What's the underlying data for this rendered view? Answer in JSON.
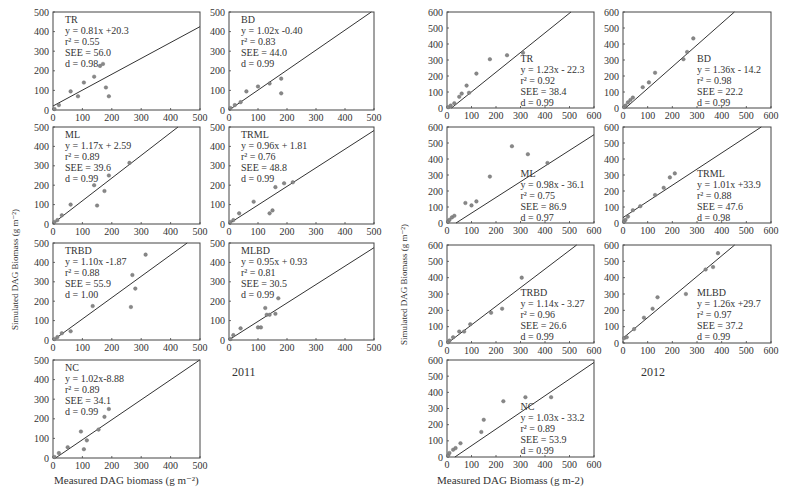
{
  "figure": {
    "left_year": "2011",
    "right_year": "2012",
    "left_xlabel": "Measured DAG biomass (g m⁻²)",
    "right_xlabel": "Measured DAG Biomass (g m-2)",
    "left_ylabel": "Simulated DAG Biomass (g m⁻²)",
    "right_ylabel": "Simulated DAG Biomass (g m⁻²)",
    "colors": {
      "axis": "#444444",
      "line": "#333333",
      "point": "#888888",
      "text": "#333333"
    }
  },
  "chart_data": [
    {
      "type": "scatter",
      "group": "2011",
      "title": "TR",
      "stats": [
        "TR",
        "y = 0.81x +20.3",
        "r² = 0.55",
        "SEE = 56.0",
        "d = 0.98"
      ],
      "slope": 0.81,
      "intercept": 20.3,
      "xlim": [
        0,
        500
      ],
      "ylim": [
        0,
        500
      ],
      "xticks": [
        0,
        100,
        200,
        300,
        400,
        500
      ],
      "yticks": [
        0,
        100,
        200,
        300,
        400,
        500
      ],
      "points": [
        [
          5,
          5
        ],
        [
          20,
          25
        ],
        [
          60,
          95
        ],
        [
          85,
          70
        ],
        [
          105,
          140
        ],
        [
          140,
          170
        ],
        [
          160,
          225
        ],
        [
          170,
          235
        ],
        [
          180,
          115
        ],
        [
          190,
          70
        ]
      ],
      "text_pos": "top-left"
    },
    {
      "type": "scatter",
      "group": "2011",
      "title": "BD",
      "stats": [
        "BD",
        "y = 1.02x -0.40",
        "r² = 0.83",
        "SEE = 44.0",
        "d = 0.99"
      ],
      "slope": 1.02,
      "intercept": -0.4,
      "xlim": [
        0,
        500
      ],
      "ylim": [
        0,
        500
      ],
      "xticks": [
        0,
        100,
        200,
        300,
        400,
        500
      ],
      "yticks": [
        0,
        100,
        200,
        300,
        400,
        500
      ],
      "points": [
        [
          5,
          10
        ],
        [
          20,
          25
        ],
        [
          40,
          40
        ],
        [
          60,
          95
        ],
        [
          100,
          120
        ],
        [
          140,
          135
        ],
        [
          180,
          160
        ],
        [
          180,
          85
        ]
      ],
      "text_pos": "top-left"
    },
    {
      "type": "scatter",
      "group": "2011",
      "title": "ML",
      "stats": [
        "ML",
        "y = 1.17x + 2.59",
        "r² = 0.89",
        "SEE = 39.6",
        "d = 0.99"
      ],
      "slope": 1.17,
      "intercept": 2.59,
      "xlim": [
        0,
        500
      ],
      "ylim": [
        0,
        500
      ],
      "xticks": [
        0,
        100,
        200,
        300,
        400,
        500
      ],
      "yticks": [
        0,
        100,
        200,
        300,
        400,
        500
      ],
      "points": [
        [
          5,
          10
        ],
        [
          15,
          20
        ],
        [
          30,
          45
        ],
        [
          60,
          100
        ],
        [
          140,
          200
        ],
        [
          150,
          95
        ],
        [
          175,
          170
        ],
        [
          190,
          250
        ],
        [
          260,
          315
        ]
      ],
      "text_pos": "top-left"
    },
    {
      "type": "scatter",
      "group": "2011",
      "title": "TRML",
      "stats": [
        "TRML",
        "y = 0.96x + 1.81",
        "r² = 0.76",
        "SEE = 48.8",
        "d = 0.99"
      ],
      "slope": 0.96,
      "intercept": 1.81,
      "xlim": [
        0,
        500
      ],
      "ylim": [
        0,
        500
      ],
      "xticks": [
        0,
        100,
        200,
        300,
        400,
        500
      ],
      "yticks": [
        0,
        100,
        200,
        300,
        400,
        500
      ],
      "points": [
        [
          5,
          10
        ],
        [
          15,
          20
        ],
        [
          35,
          55
        ],
        [
          85,
          115
        ],
        [
          140,
          55
        ],
        [
          150,
          70
        ],
        [
          160,
          190
        ],
        [
          190,
          210
        ],
        [
          220,
          215
        ]
      ],
      "text_pos": "top-left"
    },
    {
      "type": "scatter",
      "group": "2011",
      "title": "TRBD",
      "stats": [
        "TRBD",
        "y = 1.10x -1.87",
        "r² = 0.88",
        "SEE = 55.9",
        "d = 1.00"
      ],
      "slope": 1.1,
      "intercept": -1.87,
      "xlim": [
        0,
        500
      ],
      "ylim": [
        0,
        500
      ],
      "xticks": [
        0,
        100,
        200,
        300,
        400,
        500
      ],
      "yticks": [
        0,
        100,
        200,
        300,
        400,
        500
      ],
      "points": [
        [
          5,
          5
        ],
        [
          15,
          15
        ],
        [
          30,
          35
        ],
        [
          60,
          45
        ],
        [
          135,
          175
        ],
        [
          265,
          170
        ],
        [
          270,
          335
        ],
        [
          280,
          265
        ],
        [
          315,
          440
        ]
      ],
      "text_pos": "top-left"
    },
    {
      "type": "scatter",
      "group": "2011",
      "title": "MLBD",
      "stats": [
        "MLBD",
        "y = 0.95x + 0.93",
        "r² = 0.81",
        "SEE = 30.5",
        "d = 0.99"
      ],
      "slope": 0.95,
      "intercept": 0.93,
      "xlim": [
        0,
        500
      ],
      "ylim": [
        0,
        500
      ],
      "xticks": [
        0,
        100,
        200,
        300,
        400,
        500
      ],
      "yticks": [
        0,
        100,
        200,
        300,
        400,
        500
      ],
      "points": [
        [
          5,
          5
        ],
        [
          15,
          25
        ],
        [
          40,
          60
        ],
        [
          100,
          65
        ],
        [
          110,
          65
        ],
        [
          125,
          165
        ],
        [
          130,
          130
        ],
        [
          140,
          130
        ],
        [
          160,
          135
        ],
        [
          170,
          215
        ]
      ],
      "text_pos": "top-left"
    },
    {
      "type": "scatter",
      "group": "2011",
      "title": "NC",
      "stats": [
        "NC",
        "y = 1.02x-8.88",
        "r² = 0.89",
        "SEE = 34.1",
        "d = 0.99"
      ],
      "slope": 1.02,
      "intercept": -8.88,
      "xlim": [
        0,
        500
      ],
      "ylim": [
        0,
        500
      ],
      "xticks": [
        0,
        100,
        200,
        300,
        400,
        500
      ],
      "yticks": [
        0,
        100,
        200,
        300,
        400,
        500
      ],
      "points": [
        [
          5,
          5
        ],
        [
          20,
          25
        ],
        [
          50,
          55
        ],
        [
          95,
          135
        ],
        [
          105,
          45
        ],
        [
          115,
          90
        ],
        [
          155,
          145
        ],
        [
          175,
          210
        ],
        [
          190,
          250
        ]
      ],
      "text_pos": "top-left"
    },
    {
      "type": "scatter",
      "group": "2012",
      "title": "TR",
      "stats": [
        "TR",
        "y = 1.23x - 22.3",
        "r² = 0.92",
        "SEE = 38.4",
        "d = 0.99"
      ],
      "slope": 1.23,
      "intercept": -22.3,
      "xlim": [
        0,
        600
      ],
      "ylim": [
        0,
        600
      ],
      "xticks": [
        0,
        100,
        200,
        300,
        400,
        500,
        600
      ],
      "yticks": [
        0,
        100,
        200,
        300,
        400,
        500,
        600
      ],
      "points": [
        [
          5,
          5
        ],
        [
          15,
          15
        ],
        [
          30,
          30
        ],
        [
          50,
          70
        ],
        [
          60,
          90
        ],
        [
          80,
          140
        ],
        [
          90,
          95
        ],
        [
          120,
          215
        ],
        [
          175,
          305
        ],
        [
          245,
          330
        ],
        [
          310,
          345
        ]
      ],
      "text_pos": "bottom-right"
    },
    {
      "type": "scatter",
      "group": "2012",
      "title": "BD",
      "stats": [
        "BD",
        "y = 1.36x - 14.2",
        "r² = 0.98",
        "SEE = 22.2",
        "d = 0.99"
      ],
      "slope": 1.36,
      "intercept": -14.2,
      "xlim": [
        0,
        600
      ],
      "ylim": [
        0,
        600
      ],
      "xticks": [
        0,
        100,
        200,
        300,
        400,
        500,
        600
      ],
      "yticks": [
        0,
        100,
        200,
        300,
        400,
        500,
        600
      ],
      "points": [
        [
          5,
          5
        ],
        [
          10,
          15
        ],
        [
          20,
          35
        ],
        [
          30,
          50
        ],
        [
          40,
          65
        ],
        [
          80,
          130
        ],
        [
          105,
          160
        ],
        [
          130,
          220
        ],
        [
          245,
          305
        ],
        [
          260,
          350
        ],
        [
          285,
          435
        ]
      ],
      "text_pos": "bottom-right"
    },
    {
      "type": "scatter",
      "group": "2012",
      "title": "ML",
      "stats": [
        "ML",
        "y = 0.98x - 36.1",
        "r² = 0.75",
        "SEE = 86.9",
        "d = 0.97"
      ],
      "slope": 0.98,
      "intercept": -36.1,
      "xlim": [
        0,
        600
      ],
      "ylim": [
        0,
        600
      ],
      "xticks": [
        0,
        100,
        200,
        300,
        400,
        500,
        600
      ],
      "yticks": [
        0,
        100,
        200,
        300,
        400,
        500,
        600
      ],
      "points": [
        [
          5,
          10
        ],
        [
          10,
          20
        ],
        [
          20,
          35
        ],
        [
          30,
          45
        ],
        [
          75,
          125
        ],
        [
          100,
          110
        ],
        [
          120,
          135
        ],
        [
          175,
          290
        ],
        [
          265,
          480
        ],
        [
          330,
          430
        ],
        [
          410,
          375
        ]
      ],
      "text_pos": "bottom-right"
    },
    {
      "type": "scatter",
      "group": "2012",
      "title": "TRML",
      "stats": [
        "TRML",
        "y = 1.01x +33.9",
        "r² = 0.88",
        "SEE = 47.6",
        "d = 0.98"
      ],
      "slope": 1.01,
      "intercept": 33.9,
      "xlim": [
        0,
        600
      ],
      "ylim": [
        0,
        600
      ],
      "xticks": [
        0,
        100,
        200,
        300,
        400,
        500,
        600
      ],
      "yticks": [
        0,
        100,
        200,
        300,
        400,
        500,
        600
      ],
      "points": [
        [
          5,
          10
        ],
        [
          10,
          20
        ],
        [
          20,
          40
        ],
        [
          40,
          80
        ],
        [
          70,
          105
        ],
        [
          130,
          175
        ],
        [
          165,
          220
        ],
        [
          190,
          285
        ],
        [
          210,
          310
        ]
      ],
      "text_pos": "bottom-right"
    },
    {
      "type": "scatter",
      "group": "2012",
      "title": "TRBD",
      "stats": [
        "TRBD",
        "y = 1.14x - 3.27",
        "r² = 0.96",
        "SEE = 26.6",
        "d = 0.99"
      ],
      "slope": 1.14,
      "intercept": -3.27,
      "xlim": [
        0,
        600
      ],
      "ylim": [
        0,
        600
      ],
      "xticks": [
        0,
        100,
        200,
        300,
        400,
        500,
        600
      ],
      "yticks": [
        0,
        100,
        200,
        300,
        400,
        500,
        600
      ],
      "points": [
        [
          5,
          5
        ],
        [
          10,
          15
        ],
        [
          25,
          35
        ],
        [
          50,
          70
        ],
        [
          70,
          70
        ],
        [
          95,
          115
        ],
        [
          180,
          185
        ],
        [
          225,
          210
        ],
        [
          305,
          400
        ]
      ],
      "text_pos": "bottom-right"
    },
    {
      "type": "scatter",
      "group": "2012",
      "title": "MLBD",
      "stats": [
        "MLBD",
        "y = 1.26x +29.7",
        "r² = 0.97",
        "SEE = 37.2",
        "d = 0.99"
      ],
      "slope": 1.26,
      "intercept": 29.7,
      "xlim": [
        0,
        600
      ],
      "ylim": [
        0,
        600
      ],
      "xticks": [
        0,
        100,
        200,
        300,
        400,
        500,
        600
      ],
      "yticks": [
        0,
        100,
        200,
        300,
        400,
        500,
        600
      ],
      "points": [
        [
          5,
          30
        ],
        [
          15,
          35
        ],
        [
          45,
          85
        ],
        [
          85,
          155
        ],
        [
          120,
          210
        ],
        [
          140,
          280
        ],
        [
          255,
          300
        ],
        [
          335,
          450
        ],
        [
          365,
          465
        ],
        [
          385,
          550
        ]
      ],
      "text_pos": "bottom-right"
    },
    {
      "type": "scatter",
      "group": "2012",
      "title": "NC",
      "stats": [
        "NC",
        "y = 1.03x - 33.2",
        "r² = 0.89",
        "SEE = 53.9",
        "d = 0.99"
      ],
      "slope": 1.03,
      "intercept": -33.2,
      "xlim": [
        0,
        600
      ],
      "ylim": [
        0,
        600
      ],
      "xticks": [
        0,
        100,
        200,
        300,
        400,
        500,
        600
      ],
      "yticks": [
        0,
        100,
        200,
        300,
        400,
        500,
        600
      ],
      "points": [
        [
          5,
          10
        ],
        [
          10,
          25
        ],
        [
          25,
          45
        ],
        [
          35,
          55
        ],
        [
          55,
          85
        ],
        [
          140,
          155
        ],
        [
          150,
          230
        ],
        [
          230,
          345
        ],
        [
          320,
          370
        ],
        [
          425,
          370
        ]
      ],
      "text_pos": "bottom-right"
    }
  ]
}
